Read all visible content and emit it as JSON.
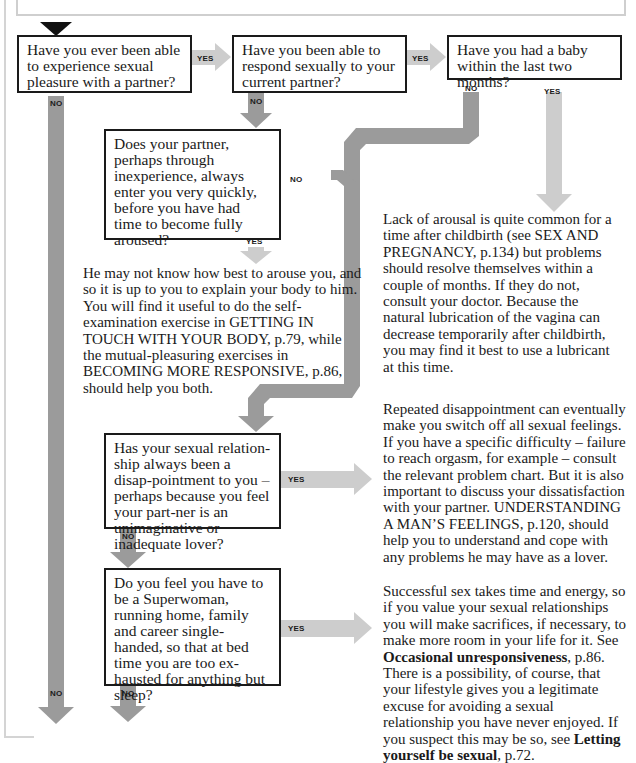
{
  "colors": {
    "no_path": "#9b9b9b",
    "yes_path": "#cdcdcd",
    "box_border": "#1a1a1a",
    "start_marker": "#111111",
    "frame": "#d4d4d4"
  },
  "labels": {
    "yes": "YES",
    "no": "NO"
  },
  "questions": [
    {
      "id": "q1",
      "text": "Have you ever been able to experience sexual pleasure with a partner?"
    },
    {
      "id": "q2",
      "text": "Have you been able to respond sexually to your current partner?"
    },
    {
      "id": "q3",
      "text": "Have you had a baby within the last two months?"
    },
    {
      "id": "q4",
      "text": "Does your partner, perhaps through inexperience, always enter you very quickly, before you have had time to become fully aroused?"
    },
    {
      "id": "q5",
      "text": "Has your sexual relation-ship always been a disap-pointment to you – perhaps because you feel your part-ner is an unimaginative or inadequate lover?"
    },
    {
      "id": "q6",
      "text": "Do you feel you have to be a Superwoman, running home, family and career single-handed, so that at bed time you are too ex-hausted for anything but sleep?"
    }
  ],
  "answers": [
    {
      "id": "a_baby",
      "text": "Lack of arousal is quite common for a time after childbirth (see SEX AND PREGNANCY, p.134) but problems should resolve themselves within a couple of months. If they do not, consult your doctor. Because the natural lubrication of the vagina can decrease temporarily after childbirth, you may find it best to use a lubricant at this time."
    },
    {
      "id": "a_partner",
      "text": "He may not know how best to arouse you, and so it is up to you to explain your body to him. You will find it useful to do the self-examination exercise in GETTING IN TOUCH WITH YOUR BODY, p.79, while the mutual-pleasuring exercises in BECOMING MORE RESPONSIVE, p.86, should help you both."
    },
    {
      "id": "a_disappointment",
      "text": "Repeated disappointment can eventually make you switch off all sexual feelings. If you have a specific difficulty – failure to reach orgasm, for example – consult the relevant problem chart. But it is also important to discuss your dissatisfaction with your partner. UNDERSTANDING A MAN’S FEELINGS, p.120, should help you to understand and cope with any problems he may have as a lover."
    },
    {
      "id": "a_superwoman",
      "text_before": "Successful sex takes time and energy, so if you value your sexual relationships you will make sacrifices, if necessary, to make more room in your life for it. See ",
      "bold1": "Occasional unresponsiveness",
      "mid": ", p.86. There is a possibility, of course, that your lifestyle gives you a legitimate excuse for avoiding a sexual relationship you have never enjoyed. If you suspect this may be so, see ",
      "bold2": "Letting yourself be sexual",
      "after": ", p.72."
    }
  ]
}
